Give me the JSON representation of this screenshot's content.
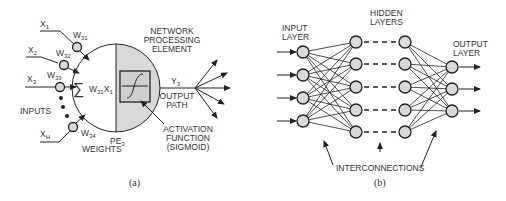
{
  "panel_a": {
    "caption": "(a)",
    "inputs": [
      {
        "x": "X",
        "x_sub": "1",
        "w": "W",
        "w_sub": "31"
      },
      {
        "x": "X",
        "x_sub": "2",
        "w": "W",
        "w_sub": "32"
      },
      {
        "x": "X",
        "x_sub": "3",
        "w": "W",
        "w_sub": "33"
      },
      {
        "x": "X",
        "x_sub": "H",
        "w": "W",
        "w_sub": "34"
      }
    ],
    "inputs_label": "INPUTS",
    "weights_label": "WEIGHTS",
    "sum_symbol": "∑",
    "sum_term": "W",
    "sum_term_sub": "31",
    "sum_term_x": "X",
    "sum_term_x_sub": "1",
    "pe_label": "PE",
    "pe_sub": "3",
    "npe_label": [
      "NETWORK",
      "PROCESSING",
      "ELEMENT"
    ],
    "output_y": "Y",
    "output_y_sub": "3",
    "output_path": [
      "OUTPUT",
      "PATH"
    ],
    "activation": [
      "ACTIVATION",
      "FUNCTION",
      "(SIGMOID)"
    ],
    "colors": {
      "shade": "#d9d9d9",
      "line": "#222222"
    }
  },
  "panel_b": {
    "caption": "(b)",
    "input_layer": [
      "INPUT",
      "LAYER"
    ],
    "hidden_layers": [
      "HIDDEN",
      "LAYERS"
    ],
    "output_layer": [
      "OUTPUT",
      "LAYER"
    ],
    "interconnections": "INTERCONNECTIONS",
    "layer_sizes": {
      "input": 4,
      "hidden1": 5,
      "hidden2": 5,
      "output": 3
    }
  }
}
